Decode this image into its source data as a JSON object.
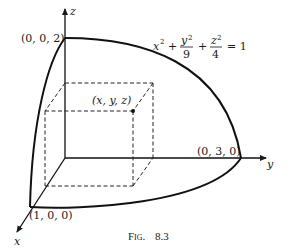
{
  "diagram": {
    "axes": {
      "x_label": "x",
      "y_label": "y",
      "z_label": "z"
    },
    "points": {
      "z_intercept": "(0, 0, 2)",
      "y_intercept": "(0, 3, 0)",
      "x_intercept": "(1, 0, 0)",
      "box_corner": "(x, y, z)"
    },
    "equation": {
      "t1": "x",
      "t1_exp": "2",
      "plus": "+",
      "y_num": "y",
      "y_exp": "2",
      "y_den": "9",
      "z_num": "z",
      "z_exp": "2",
      "z_den": "4",
      "eq": "= 1"
    },
    "caption": {
      "prefix": "Fig.",
      "number": "8.3"
    }
  }
}
